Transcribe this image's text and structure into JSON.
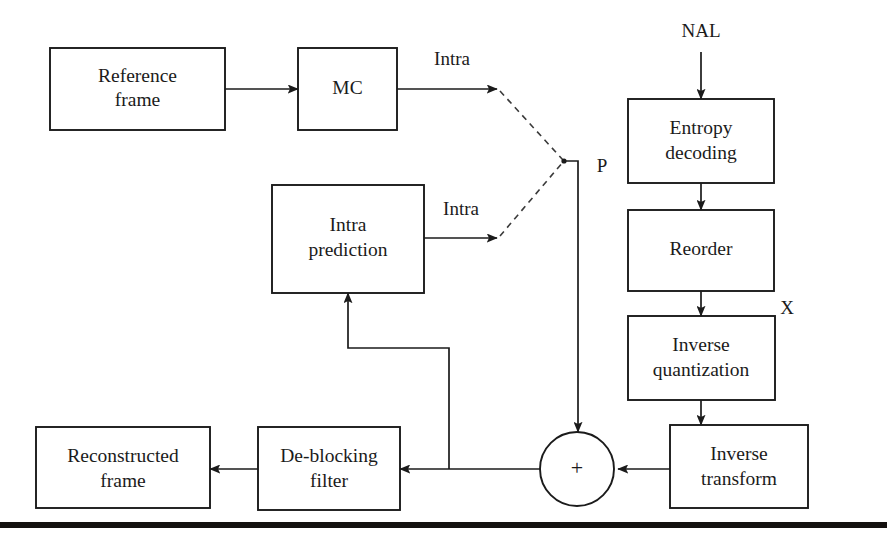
{
  "figure": {
    "background_color": "#ffffff",
    "line_color": "#1b1b1b",
    "rule_bar_color": "#14110f"
  },
  "blocks": [
    {
      "id": "reference_frame",
      "label_line1": "Reference",
      "label_line2": "frame"
    },
    {
      "id": "mc",
      "label_line1": "MC",
      "label_line2": ""
    },
    {
      "id": "intra_prediction",
      "label_line1": "Intra",
      "label_line2": "prediction"
    },
    {
      "id": "entropy_decoding",
      "label_line1": "Entropy",
      "label_line2": "decoding"
    },
    {
      "id": "reorder",
      "label_line1": "Reorder",
      "label_line2": ""
    },
    {
      "id": "inverse_quantization",
      "label_line1": "Inverse",
      "label_line2": "quantization"
    },
    {
      "id": "inverse_transform",
      "label_line1": "Inverse",
      "label_line2": "transform"
    },
    {
      "id": "deblocking_filter",
      "label_line1": "De-blocking",
      "label_line2": "filter"
    },
    {
      "id": "reconstructed_frame",
      "label_line1": "Reconstructed",
      "label_line2": "frame"
    }
  ],
  "nodes": {
    "summation": {
      "id": "summation",
      "symbol": "+"
    }
  },
  "edge_labels": {
    "intra_top": "Intra",
    "intra_bottom": "Intra",
    "prediction_p": "P",
    "coefficients_x": "X",
    "input_nal": "NAL"
  }
}
